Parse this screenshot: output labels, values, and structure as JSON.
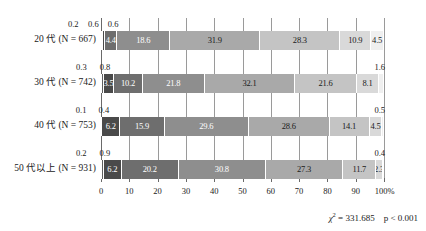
{
  "chart_data": {
    "type": "bar",
    "subtype": "100% stacked horizontal bar",
    "title": "",
    "xlabel": "",
    "ylabel": "",
    "xlim": [
      0,
      100
    ],
    "xticks": [
      "0",
      "10",
      "20",
      "30",
      "40",
      "50",
      "60",
      "70",
      "80",
      "90",
      "100%"
    ],
    "xtick_values": [
      0,
      10,
      20,
      30,
      40,
      50,
      60,
      70,
      80,
      90,
      100
    ],
    "grid": true,
    "legend": "none",
    "categories": [
      "20 代 (N = 667)",
      "30 代 (N = 742)",
      "40 代 (N = 753)",
      "50 代以上 (N = 931)"
    ],
    "rows": [
      {
        "category": "20 代 (N = 667)",
        "n": 667,
        "values": [
          0.2,
          0.6,
          0.6,
          4.4,
          18.6,
          31.9,
          28.3,
          10.9,
          4.5
        ],
        "inside_labels": [
          "",
          "",
          "",
          "4.4",
          "18.6",
          "31.9",
          "28.3",
          "10.9",
          "4.5"
        ],
        "callout_left": [
          "0.2",
          "0.6",
          "0.6"
        ],
        "callout_right": ""
      },
      {
        "category": "30 代 (N = 742)",
        "n": 742,
        "values": [
          0.3,
          0.8,
          3.5,
          10.2,
          21.8,
          32.1,
          21.6,
          8.1,
          1.6
        ],
        "inside_labels": [
          "",
          "",
          "3.5",
          "10.2",
          "21.8",
          "32.1",
          "21.6",
          "8.1",
          ""
        ],
        "callout_left": [
          "0.3",
          "0.8"
        ],
        "callout_right": "1.6"
      },
      {
        "category": "40 代 (N = 753)",
        "n": 753,
        "values": [
          0.1,
          0.4,
          6.2,
          15.9,
          29.6,
          28.6,
          14.1,
          4.5,
          0.5
        ],
        "inside_labels": [
          "",
          "",
          "6.2",
          "15.9",
          "29.6",
          "28.6",
          "14.1",
          "4.5",
          ""
        ],
        "callout_left": [
          "0.1",
          "0.4"
        ],
        "callout_right": "0.5"
      },
      {
        "category": "50 代以上 (N = 931)",
        "n": 931,
        "values": [
          0.2,
          0.9,
          6.2,
          20.2,
          30.8,
          27.3,
          11.7,
          2.3,
          0.4
        ],
        "inside_labels": [
          "",
          "",
          "6.2",
          "20.2",
          "30.8",
          "27.3",
          "11.7",
          "2.3",
          ""
        ],
        "callout_left": [
          "0.2",
          "0.9"
        ],
        "callout_right": "0.4"
      }
    ],
    "series_colors": [
      "#7a7a7a",
      "#5e5e5e",
      "#4a4a4a",
      "#6e6e6e",
      "#8e8e8e",
      "#a9a9a9",
      "#c4c4c4",
      "#d9d9d9",
      "#efefef"
    ],
    "annotation": {
      "chi_symbol": "χ",
      "chi_exponent": "2",
      "chi_equals": "= 331.685",
      "chi_value": 331.685,
      "p_text": "p < 0.001"
    }
  },
  "colors": {
    "grid": "#9a9a9a",
    "axis": "#6a6a6a",
    "text": "#1a1a1a",
    "background": "#ffffff"
  }
}
